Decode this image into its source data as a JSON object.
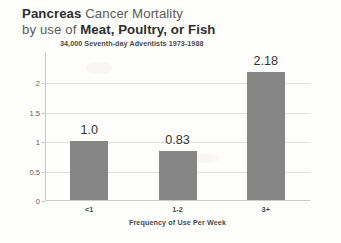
{
  "title": {
    "line1_strong": "Pancreas",
    "line1_rest": " Cancer Mortality",
    "line2_lead": "by use of ",
    "line2_strong": "Meat, Poultry, or Fish",
    "subtitle": "34,000 Seventh-day Adventists 1973-1988"
  },
  "chart_data": {
    "type": "bar",
    "title": "Pancreas Cancer Mortality by use of Meat, Poultry, or Fish",
    "subtitle": "34,000 Seventh-day Adventists 1973-1988",
    "categories": [
      "<1",
      "1-2",
      "3+"
    ],
    "values": [
      1.0,
      0.83,
      2.18
    ],
    "data_labels": [
      "1.0",
      "0.83",
      "2.18"
    ],
    "xlabel": "Frequency of Use Per Week",
    "ylabel": "",
    "ylim": [
      0,
      2.5
    ],
    "yticks": [
      0,
      0.5,
      1,
      1.5,
      2
    ],
    "ytick_labels": [
      "0",
      "0.5",
      "1",
      "1.5",
      "2"
    ],
    "grid": true,
    "legend": false,
    "bar_color": "#868686",
    "gridline_color": "#e2e2e2",
    "axis_color": "#c9c9c9",
    "text_color": "#333333"
  }
}
